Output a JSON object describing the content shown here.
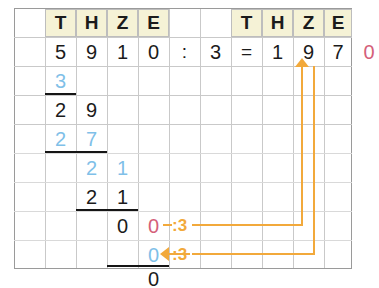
{
  "worksheet": {
    "title": "Schriftliche Division",
    "place_value_headers": [
      "T",
      "H",
      "Z",
      "E"
    ],
    "equation": {
      "dividend_digits": [
        "5",
        "9",
        "1",
        "0"
      ],
      "division_sign": ":",
      "divisor": "3",
      "equals_sign": "=",
      "quotient_digits": [
        "1",
        "9",
        "7",
        "0"
      ],
      "quotient_last_digit_color": "#d4607a"
    },
    "work_rows": [
      {
        "row": 1,
        "cells": [
          {
            "col": 0,
            "text": "3",
            "color": "blue"
          }
        ]
      },
      {
        "row": 2,
        "cells": [
          {
            "col": 0,
            "text": "2",
            "color": "black"
          },
          {
            "col": 1,
            "text": "9",
            "color": "black"
          }
        ]
      },
      {
        "row": 3,
        "cells": [
          {
            "col": 0,
            "text": "2",
            "color": "blue"
          },
          {
            "col": 1,
            "text": "7",
            "color": "blue"
          }
        ]
      },
      {
        "row": 4,
        "cells": [
          {
            "col": 1,
            "text": "2",
            "color": "blue"
          },
          {
            "col": 2,
            "text": "1",
            "color": "blue"
          }
        ]
      },
      {
        "row": 5,
        "cells": [
          {
            "col": 1,
            "text": "2",
            "color": "black"
          },
          {
            "col": 2,
            "text": "1",
            "color": "black"
          }
        ]
      },
      {
        "row": 6,
        "cells": [
          {
            "col": 2,
            "text": "0",
            "color": "black"
          },
          {
            "col": 3,
            "text": "0",
            "color": "pink"
          }
        ]
      },
      {
        "row": 7,
        "cells": [
          {
            "col": 3,
            "text": "0",
            "color": "blue"
          }
        ]
      },
      {
        "row": 8,
        "cells": [
          {
            "col": 3,
            "text": "0",
            "color": "black"
          }
        ]
      }
    ],
    "annotations": {
      "divide_label_top": ":3",
      "divide_label_bottom": ":3",
      "arrow_up_target": "quotient-last-digit",
      "arrow_left_target": "remainder-zero",
      "color": "#f2a93b"
    },
    "colors": {
      "header_fill": "#f5f2d6",
      "grid_line": "#c9c9c9",
      "digit_black": "#1b1b1b",
      "digit_blue": "#7fc0e8",
      "digit_pink": "#d4607a",
      "annotation_orange": "#f2a93b"
    }
  }
}
